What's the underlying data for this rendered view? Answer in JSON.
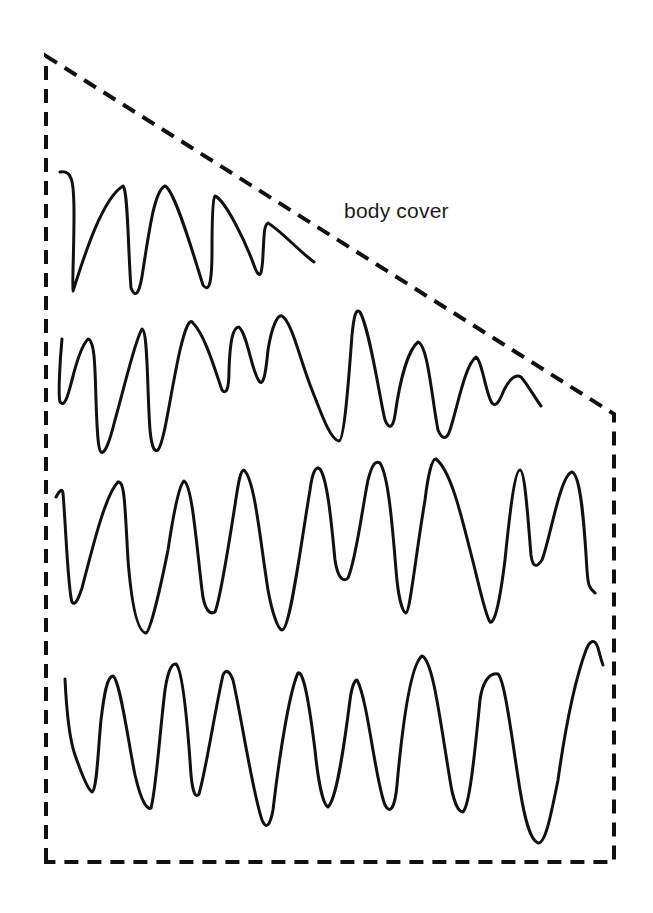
{
  "diagram": {
    "label": "body cover",
    "outline": {
      "style": "dashed",
      "shape": "trapezoid",
      "color": "#111111"
    },
    "traces": [
      {
        "name": "waveform-1",
        "description": "decaying oscillation under sloped cover, 5 peaks"
      },
      {
        "name": "waveform-2",
        "description": "irregular oscillation, amplitude decreasing to the right"
      },
      {
        "name": "waveform-3",
        "description": "large regular oscillation, 10 peaks"
      },
      {
        "name": "waveform-4",
        "description": "large regular oscillation, 10 peaks, rising at end"
      }
    ]
  }
}
